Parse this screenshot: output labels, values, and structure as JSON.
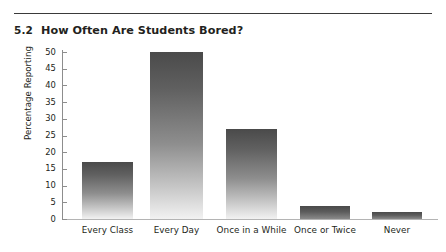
{
  "figure": {
    "number": "5.2",
    "title": "How Often Are Students Bored?"
  },
  "chart_data": {
    "type": "bar",
    "title": "How Often Are Students Bored?",
    "xlabel": "",
    "ylabel": "Percentage Reporting",
    "categories": [
      "Every Class",
      "Every Day",
      "Once in a While",
      "Once or Twice",
      "Never"
    ],
    "values": [
      17,
      50,
      27,
      4,
      2
    ],
    "ylim": [
      0,
      50
    ],
    "yticks": [
      0,
      5,
      10,
      15,
      20,
      25,
      30,
      35,
      40,
      45,
      50
    ],
    "ytick_labels": [
      "0",
      "5",
      "10",
      "15",
      "20",
      "25",
      "30",
      "35",
      "40",
      "45",
      "50"
    ],
    "grid": false,
    "legend": null,
    "bar_color": "#6e6e6e",
    "bar_gradient": [
      "#4a4a4a",
      "#f2f2f2"
    ]
  }
}
